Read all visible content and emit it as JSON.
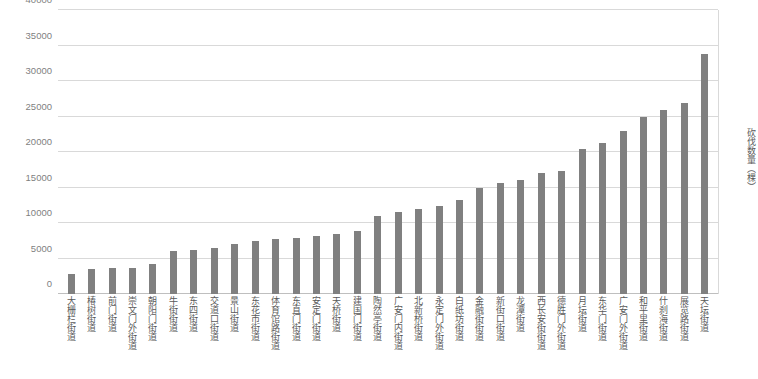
{
  "chart_data": {
    "type": "bar",
    "title": "",
    "xlabel": "",
    "ylabel": "砍伐数量（棵）",
    "ylim": [
      0,
      40000
    ],
    "ytick_labels": [
      "40000",
      "35000",
      "30000",
      "25000",
      "20000",
      "15000",
      "10000",
      "5000",
      "0"
    ],
    "ytick_values": [
      40000,
      35000,
      30000,
      25000,
      20000,
      15000,
      10000,
      5000,
      0
    ],
    "grid": true,
    "legend": null,
    "bar_color": "#808080",
    "gridline_color": "#d9d9d9",
    "categories": [
      "大栅栏街道",
      "椿树街道",
      "前门街道",
      "崇文门外街道",
      "朝阳门街道",
      "牛街街道",
      "东四街道",
      "交道口街道",
      "景山街道",
      "东花市街道",
      "体育馆路街道",
      "东直门街道",
      "安定门街道",
      "天桥街道",
      "建国门街道",
      "陶然亭街道",
      "广安门内街道",
      "北新桥街道",
      "永定门外街道",
      "白纸坊街道",
      "金融街街道",
      "新街口街道",
      "龙潭街道",
      "西长安街街道",
      "德胜门外街道",
      "月坛街道",
      "东华门街道",
      "广安门外街道",
      "和平里街道",
      "什刹海街道",
      "展览路街道",
      "天坛街道"
    ],
    "values": [
      2800,
      3500,
      3600,
      3700,
      4200,
      6000,
      6200,
      6500,
      7000,
      7500,
      7800,
      7900,
      8200,
      8400,
      8900,
      11000,
      11500,
      12000,
      12400,
      13300,
      14900,
      15600,
      16000,
      17100,
      17300,
      20400,
      21200,
      23000,
      25000,
      25900,
      26900,
      33800
    ]
  }
}
